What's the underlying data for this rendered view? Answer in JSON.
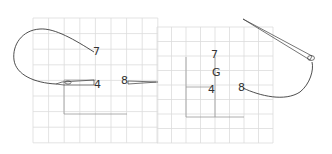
{
  "colors": {
    "background": "#ffffff",
    "grid_minor": "#dcdcdc",
    "grid_major": "#9a9a9a",
    "curve": "#3a3a3a",
    "label": "#333333"
  },
  "panels": [
    {
      "name": "left-panel",
      "grid": {
        "x": 33,
        "y": 18,
        "cols": 8,
        "rows": 8,
        "cell": 15.6
      },
      "labels": [
        {
          "text": "7",
          "x": 93,
          "y": 55
        },
        {
          "text": "4",
          "x": 94,
          "y": 88
        },
        {
          "text": "8",
          "x": 121,
          "y": 84
        }
      ]
    },
    {
      "name": "right-panel",
      "grid": {
        "x": 157,
        "y": 27,
        "cols": 8,
        "rows": 8,
        "cell": 14.5
      },
      "labels": [
        {
          "text": "7",
          "x": 211,
          "y": 58
        },
        {
          "text": "G",
          "x": 212,
          "y": 76
        },
        {
          "text": "4",
          "x": 208,
          "y": 93
        },
        {
          "text": "8",
          "x": 238,
          "y": 91
        }
      ]
    }
  ]
}
